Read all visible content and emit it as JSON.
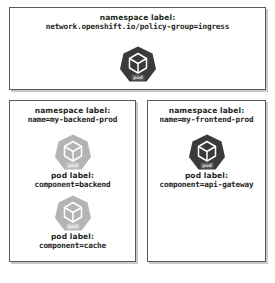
{
  "diagram": {
    "namespaces": [
      {
        "id": "ingress",
        "label_title": "namespace label:",
        "label_value": "network.openshift.io/policy-group=ingress",
        "pods": [
          {
            "icon": "kubernetes-pod-icon",
            "icon_text": "pod",
            "icon_color": "#3a3a3a",
            "label_title": "",
            "label_value": ""
          }
        ]
      },
      {
        "id": "backend",
        "label_title": "namespace label:",
        "label_value": "name=my-backend-prod",
        "pods": [
          {
            "icon": "kubernetes-pod-icon",
            "icon_text": "pod",
            "icon_color": "#b4b4b4",
            "label_title": "pod label:",
            "label_value": "component=backend"
          },
          {
            "icon": "kubernetes-pod-icon",
            "icon_text": "pod",
            "icon_color": "#b4b4b4",
            "label_title": "pod label:",
            "label_value": "component=cache"
          }
        ]
      },
      {
        "id": "frontend",
        "label_title": "namespace label:",
        "label_value": "name=my-frontend-prod",
        "pods": [
          {
            "icon": "kubernetes-pod-icon",
            "icon_text": "pod",
            "icon_color": "#3a3a3a",
            "label_title": "pod label:",
            "label_value": "component=api-gateway"
          }
        ]
      }
    ],
    "colors": {
      "box_border": "#58595b",
      "box_shadow": "#c9c9c9",
      "text": "#231f20",
      "pod_dark": "#3a3a3a",
      "pod_light": "#b4b4b4",
      "background": "#ffffff"
    }
  }
}
